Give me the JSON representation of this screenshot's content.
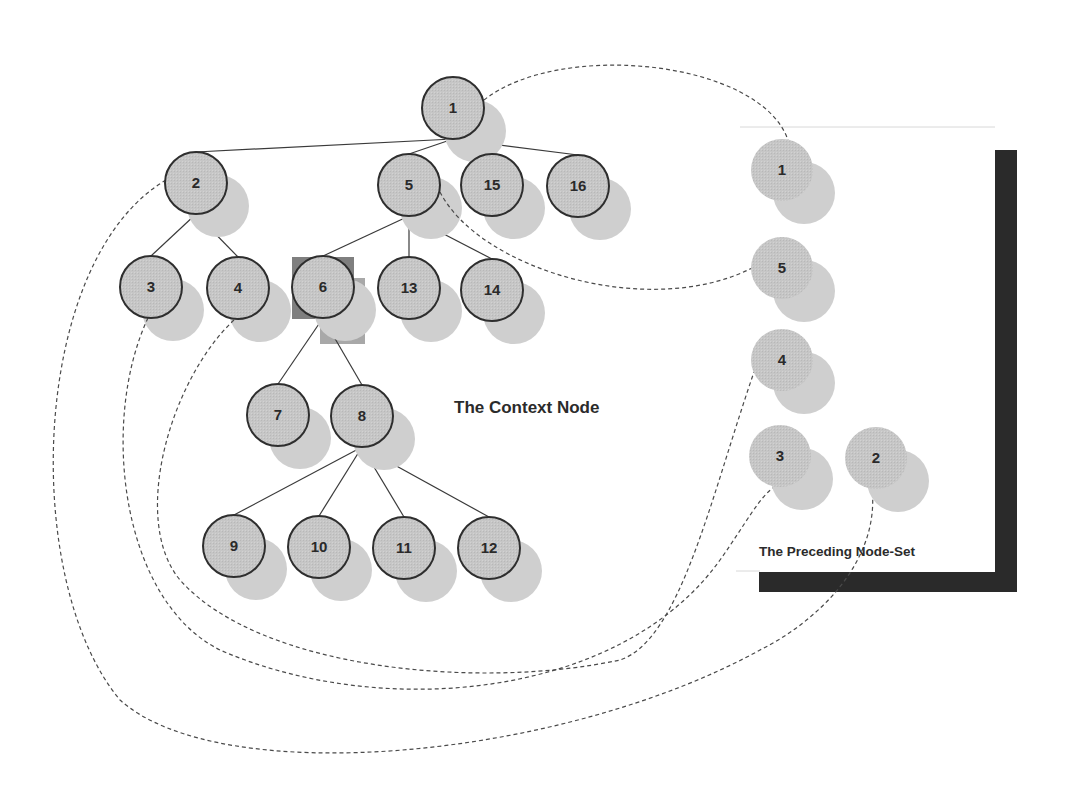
{
  "captions": {
    "context_node": "The Context Node",
    "preceding_node_set": "The Preceding Node-Set"
  },
  "colors": {
    "node_fill": "#c4c4c4",
    "node_shadow": "#cfcfcf",
    "node_stroke": "#2e2e2e",
    "edge": "#3a3a3a",
    "dashed": "#4a4a4a",
    "context_highlight": "#7f7f7f",
    "context_highlight_light": "#a8a8a8",
    "frame_bar": "#2a2a2a"
  },
  "tree": {
    "nodes": [
      {
        "id": "1",
        "label": "1",
        "x": 453,
        "y": 108
      },
      {
        "id": "2",
        "label": "2",
        "x": 196,
        "y": 183
      },
      {
        "id": "5",
        "label": "5",
        "x": 409,
        "y": 185
      },
      {
        "id": "15",
        "label": "15",
        "x": 492,
        "y": 185
      },
      {
        "id": "16",
        "label": "16",
        "x": 578,
        "y": 186
      },
      {
        "id": "3",
        "label": "3",
        "x": 151,
        "y": 287
      },
      {
        "id": "4",
        "label": "4",
        "x": 238,
        "y": 288
      },
      {
        "id": "6",
        "label": "6",
        "x": 323,
        "y": 287
      },
      {
        "id": "13",
        "label": "13",
        "x": 409,
        "y": 288
      },
      {
        "id": "14",
        "label": "14",
        "x": 492,
        "y": 290
      },
      {
        "id": "7",
        "label": "7",
        "x": 278,
        "y": 415
      },
      {
        "id": "8",
        "label": "8",
        "x": 362,
        "y": 416
      },
      {
        "id": "9",
        "label": "9",
        "x": 234,
        "y": 546
      },
      {
        "id": "10",
        "label": "10",
        "x": 319,
        "y": 547
      },
      {
        "id": "11",
        "label": "11",
        "x": 404,
        "y": 548
      },
      {
        "id": "12",
        "label": "12",
        "x": 489,
        "y": 548
      }
    ],
    "edges": [
      [
        "1",
        "2"
      ],
      [
        "1",
        "5"
      ],
      [
        "1",
        "15"
      ],
      [
        "1",
        "16"
      ],
      [
        "2",
        "3"
      ],
      [
        "2",
        "4"
      ],
      [
        "5",
        "6"
      ],
      [
        "5",
        "13"
      ],
      [
        "5",
        "14"
      ],
      [
        "6",
        "7"
      ],
      [
        "6",
        "8"
      ],
      [
        "8",
        "9"
      ],
      [
        "8",
        "10"
      ],
      [
        "8",
        "11"
      ],
      [
        "8",
        "12"
      ]
    ],
    "context_node": "6"
  },
  "preceding_set": {
    "nodes": [
      {
        "id": "p1",
        "label": "1",
        "x": 782,
        "y": 170
      },
      {
        "id": "p5",
        "label": "5",
        "x": 782,
        "y": 268
      },
      {
        "id": "p4",
        "label": "4",
        "x": 782,
        "y": 360
      },
      {
        "id": "p3",
        "label": "3",
        "x": 780,
        "y": 456
      },
      {
        "id": "p2",
        "label": "2",
        "x": 876,
        "y": 458
      }
    ]
  },
  "links": [
    {
      "from": "1",
      "to": "p1",
      "path": "M 484 100 C 560 40, 760 60, 788 140"
    },
    {
      "from": "5",
      "to": "p5",
      "path": "M 440 192 C 480 270, 650 320, 752 268"
    },
    {
      "from": "2",
      "to": "p2",
      "path": "M 166 180 C 30 260, 20 580, 120 700 C 220 790, 560 760, 760 650 C 820 620, 880 560, 872 488"
    },
    {
      "from": "3",
      "to": "p3",
      "path": "M 148 318 C 100 420, 120 600, 220 650 C 380 720, 620 700, 720 560 C 745 525, 760 495, 776 486"
    },
    {
      "from": "4",
      "to": "p4",
      "path": "M 234 320 C 170 380, 130 520, 180 580 C 260 670, 480 690, 620 660 C 680 640, 710 500, 754 372"
    }
  ]
}
